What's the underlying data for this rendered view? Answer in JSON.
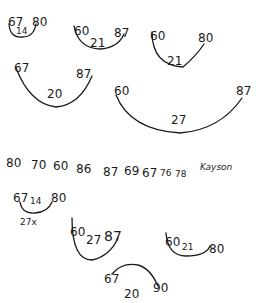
{
  "groups": [
    {
      "left": "67",
      "middle": "14",
      "right": "80"
    },
    {
      "left": "60",
      "middle": "21",
      "right": "87"
    },
    {
      "left": "60",
      "middle": "21",
      "right": "80"
    },
    {
      "left": "67",
      "middle": "20",
      "right": "87"
    },
    {
      "left": "60",
      "middle": "27",
      "right": "87"
    }
  ],
  "number_list": [
    "80",
    "70",
    "60",
    "86",
    "87",
    "69",
    "67",
    "76",
    "78"
  ],
  "name": "Kayson",
  "bottom_groups": [
    {
      "left": "67",
      "middle": "14",
      "right": "80",
      "note": "27x"
    },
    {
      "left": "60",
      "middle": "27",
      "right": "87"
    },
    {
      "left": "60",
      "middle": "21",
      "right": "80"
    },
    {
      "left": "67",
      "middle": "20",
      "right": "90"
    }
  ]
}
